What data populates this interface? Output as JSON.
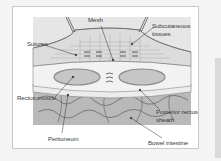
{
  "diagram": {
    "labels": {
      "mesh": "Mesh",
      "subcutaneous_1": "Subcutaneous",
      "subcutaneous_2": "tissues",
      "sutures": "Sutures",
      "rectus_muscle": "Rectus muscle",
      "posterior_1": "Posterior rectus",
      "posterior_2": "sheath",
      "peritoneum": "Peritoneum",
      "bowel": "Bowel intestine"
    },
    "colors": {
      "background": "#f4f4f4",
      "frame": "#ffffff",
      "tissue": "#d4d4d4",
      "muscle": "#c2c2c2",
      "bowel": "#b8b8b8",
      "line": "#555555"
    }
  }
}
